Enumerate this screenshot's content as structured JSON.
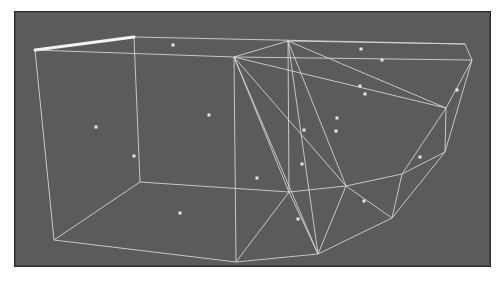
{
  "viewport": {
    "title": "",
    "background_color": "#5b5b5b",
    "border_color": "#2a2a2a",
    "wire_color": "#d8d8d8",
    "highlight_edge_color": "#f2f2f2",
    "point_color": "#e6e6e6"
  },
  "mesh": {
    "vertices": {
      "A": [
        35,
        50
      ],
      "B": [
        134,
        37
      ],
      "C": [
        234,
        57
      ],
      "D": [
        288,
        41
      ],
      "E": [
        465,
        44
      ],
      "F": [
        472,
        60
      ],
      "G": [
        446,
        108
      ],
      "H": [
        445,
        152
      ],
      "I": [
        54,
        240
      ],
      "J": [
        140,
        182
      ],
      "K": [
        236,
        262
      ],
      "L": [
        318,
        254
      ],
      "M": [
        392,
        218
      ],
      "N": [
        289,
        192
      ],
      "O": [
        346,
        186
      ],
      "P": [
        402,
        174
      ]
    },
    "highlighted_edge": [
      "A",
      "B"
    ],
    "edges": [
      [
        "B",
        "E"
      ],
      [
        "A",
        "C"
      ],
      [
        "C",
        "F"
      ],
      [
        "E",
        "F"
      ],
      [
        "C",
        "D"
      ],
      [
        "A",
        "I"
      ],
      [
        "B",
        "J"
      ],
      [
        "J",
        "I"
      ],
      [
        "J",
        "N"
      ],
      [
        "C",
        "K"
      ],
      [
        "I",
        "K"
      ],
      [
        "K",
        "L"
      ],
      [
        "L",
        "M"
      ],
      [
        "M",
        "H"
      ],
      [
        "H",
        "F"
      ],
      [
        "D",
        "E"
      ],
      [
        "D",
        "N"
      ],
      [
        "D",
        "O"
      ],
      [
        "D",
        "L"
      ],
      [
        "C",
        "N"
      ],
      [
        "C",
        "O"
      ],
      [
        "C",
        "G"
      ],
      [
        "C",
        "L"
      ],
      [
        "D",
        "G"
      ],
      [
        "G",
        "H"
      ],
      [
        "G",
        "F"
      ],
      [
        "N",
        "O"
      ],
      [
        "O",
        "P"
      ],
      [
        "P",
        "G"
      ],
      [
        "P",
        "H"
      ],
      [
        "N",
        "K"
      ],
      [
        "N",
        "L"
      ],
      [
        "O",
        "M"
      ],
      [
        "P",
        "M"
      ],
      [
        "O",
        "L"
      ]
    ],
    "points": [
      [
        173,
        45
      ],
      [
        361,
        49
      ],
      [
        382,
        60
      ],
      [
        360,
        86
      ],
      [
        365,
        94
      ],
      [
        337,
        118
      ],
      [
        336,
        131
      ],
      [
        304,
        130
      ],
      [
        96,
        127
      ],
      [
        209,
        115
      ],
      [
        134,
        156
      ],
      [
        420,
        157
      ],
      [
        457,
        90
      ],
      [
        302,
        164
      ],
      [
        257,
        178
      ],
      [
        364,
        201
      ],
      [
        180,
        213
      ],
      [
        298,
        219
      ]
    ]
  }
}
